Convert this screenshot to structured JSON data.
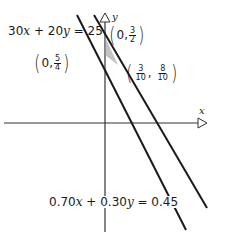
{
  "axes": {
    "x_label": "x",
    "y_label": "y"
  },
  "equations": {
    "eq1": {
      "a": "30",
      "x": "x",
      "plus": " + ",
      "b": "20",
      "y": "y",
      "rhs": " = 25"
    },
    "eq2": {
      "a": "0.70",
      "x": "x",
      "plus": " + ",
      "b": "0.30",
      "y": "y",
      "rhs": " = 0.45"
    }
  },
  "points": {
    "p1": {
      "x": "0",
      "sep": ",",
      "num": "3",
      "den": "2"
    },
    "p2": {
      "x": "0",
      "sep": ",",
      "num": "5",
      "den": "4"
    },
    "p3": {
      "xnum": "3",
      "xden": "10",
      "sep": ",",
      "ynum": "8",
      "yden": "10"
    }
  },
  "colors": {
    "line": "#1a1a1a",
    "axis": "#333333",
    "background": "#ffffff"
  }
}
